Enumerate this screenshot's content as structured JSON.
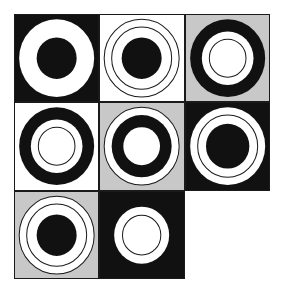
{
  "puzzle": {
    "title": "Matrix reasoning figure",
    "kind": "3x3-matrix-of-concentric-circle-tiles",
    "grid": {
      "rows": 3,
      "columns": 3,
      "missing_cell": "row3-col3"
    },
    "palette": {
      "black": "#111111",
      "white": "#ffffff",
      "gray": "#c8c8c8",
      "outline": "#1a1a1a",
      "page_background": "#ffffff"
    },
    "geometry": {
      "viewbox": 100,
      "center_x": 50,
      "center_y": 50,
      "radius_outer": 45,
      "radius_mid": 36,
      "radius_inner": 24,
      "stroke_width": 1.2
    },
    "cells": [
      {
        "id": "row1-col1",
        "row": 1,
        "column": 1,
        "name": "black-tile-white-annulus",
        "background": "#111111",
        "shapes": [
          {
            "role": "outer-disk",
            "r": 45,
            "fill": "#ffffff",
            "stroke": "none"
          },
          {
            "role": "inner-disk",
            "r": 24,
            "fill": "#111111",
            "stroke": "none"
          }
        ]
      },
      {
        "id": "row1-col2",
        "row": 1,
        "column": 2,
        "name": "white-tile-outlined-rings-black-core",
        "background": "#ffffff",
        "shapes": [
          {
            "role": "outer-ring-outline",
            "r": 45,
            "fill": "none",
            "stroke": "#1a1a1a"
          },
          {
            "role": "mid-ring-outline",
            "r": 36,
            "fill": "none",
            "stroke": "#1a1a1a"
          },
          {
            "role": "inner-disk",
            "r": 24,
            "fill": "#111111",
            "stroke": "none"
          }
        ]
      },
      {
        "id": "row1-col3",
        "row": 1,
        "column": 3,
        "name": "gray-tile-black-annulus-white-core",
        "background": "#c8c8c8",
        "shapes": [
          {
            "role": "outer-disk",
            "r": 45,
            "fill": "#111111",
            "stroke": "none"
          },
          {
            "role": "mid-disk",
            "r": 31,
            "fill": "#ffffff",
            "stroke": "none"
          },
          {
            "role": "inner-ring-outline",
            "r": 22,
            "fill": "none",
            "stroke": "#1a1a1a"
          }
        ]
      },
      {
        "id": "row2-col1",
        "row": 2,
        "column": 1,
        "name": "white-tile-black-annulus-white-core",
        "background": "#ffffff",
        "shapes": [
          {
            "role": "outer-disk",
            "r": 45,
            "fill": "#111111",
            "stroke": "none"
          },
          {
            "role": "mid-disk",
            "r": 31,
            "fill": "#ffffff",
            "stroke": "none"
          },
          {
            "role": "inner-ring-outline",
            "r": 22,
            "fill": "none",
            "stroke": "#1a1a1a"
          }
        ]
      },
      {
        "id": "row2-col2",
        "row": 2,
        "column": 2,
        "name": "gray-tile-white-disk-black-annulus-white-core",
        "background": "#c8c8c8",
        "shapes": [
          {
            "role": "outer-disk",
            "r": 45,
            "fill": "#ffffff",
            "stroke": "#1a1a1a"
          },
          {
            "role": "mid-disk",
            "r": 36,
            "fill": "#111111",
            "stroke": "none"
          },
          {
            "role": "inner-disk",
            "r": 22,
            "fill": "#ffffff",
            "stroke": "none"
          }
        ]
      },
      {
        "id": "row2-col3",
        "row": 2,
        "column": 3,
        "name": "black-tile-white-disk-outline-black-core",
        "background": "#111111",
        "shapes": [
          {
            "role": "outer-disk",
            "r": 45,
            "fill": "#ffffff",
            "stroke": "none"
          },
          {
            "role": "mid-ring-outline",
            "r": 36,
            "fill": "none",
            "stroke": "#1a1a1a"
          },
          {
            "role": "inner-disk",
            "r": 26,
            "fill": "#111111",
            "stroke": "none"
          }
        ]
      },
      {
        "id": "row3-col1",
        "row": 3,
        "column": 1,
        "name": "gray-tile-white-disk-outline-black-core",
        "background": "#c8c8c8",
        "shapes": [
          {
            "role": "outer-disk",
            "r": 45,
            "fill": "#ffffff",
            "stroke": "#1a1a1a"
          },
          {
            "role": "mid-ring-outline",
            "r": 36,
            "fill": "none",
            "stroke": "#1a1a1a"
          },
          {
            "role": "inner-disk",
            "r": 24,
            "fill": "#111111",
            "stroke": "none"
          }
        ]
      },
      {
        "id": "row3-col2",
        "row": 3,
        "column": 2,
        "name": "black-tile-small-white-disk-outline",
        "background": "#111111",
        "shapes": [
          {
            "role": "outer-disk",
            "r": 33,
            "fill": "#ffffff",
            "stroke": "none"
          },
          {
            "role": "inner-ring-outline",
            "r": 23,
            "fill": "none",
            "stroke": "#1a1a1a"
          }
        ]
      },
      {
        "id": "row3-col3",
        "row": 3,
        "column": 3,
        "name": "missing-answer-cell",
        "background": "#ffffff",
        "shapes": []
      }
    ]
  }
}
